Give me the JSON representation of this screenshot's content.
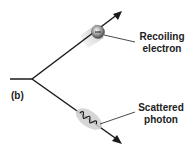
{
  "diagram": {
    "panel_label": "(b)",
    "labels": {
      "electron": [
        "Recoiling",
        "electron"
      ],
      "photon": [
        "Scattered",
        "photon"
      ]
    },
    "colors": {
      "line": "#1a1a1a",
      "electron_sphere": "#8a8a8a",
      "photon_blob": "#c8c8c8"
    }
  }
}
